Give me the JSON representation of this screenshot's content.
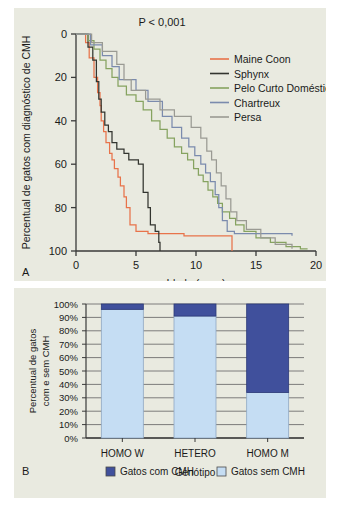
{
  "figure": {
    "background": "#e9eae0",
    "page_background": "#ffffff"
  },
  "panel_a": {
    "label": "A",
    "pvalue": "P < 0,001",
    "ylabel": "Percentual de gatos com diagnóstico de CMH",
    "xlabel": "Idade (anos)",
    "yticks": [
      "0",
      "20",
      "40",
      "60",
      "80",
      "100"
    ],
    "xticks": [
      "0",
      "5",
      "10",
      "15",
      "20"
    ],
    "legend": [
      {
        "label": "Maine Coon",
        "color": "#e8734a"
      },
      {
        "label": "Sphynx",
        "color": "#33352f"
      },
      {
        "label": "Pelo Curto Doméstico",
        "color": "#86a360"
      },
      {
        "label": "Chartreux",
        "color": "#7b8bad"
      },
      {
        "label": "Persa",
        "color": "#9a9a93"
      }
    ]
  },
  "panel_b": {
    "label": "B",
    "ylabel_line1": "Percentual de gatos",
    "ylabel_line2": "com e sem CMH",
    "xlabel": "Genótipo",
    "yticks": [
      "100%",
      "90%",
      "80%",
      "70%",
      "60%",
      "50%",
      "40%",
      "30%",
      "20%",
      "10%",
      "0%"
    ],
    "legend": [
      {
        "label": "Gatos com CMH",
        "color": "#40509c"
      },
      {
        "label": "Gatos sem CMH",
        "color": "#c5ddf3"
      }
    ]
  },
  "chart_data": [
    {
      "type": "line",
      "title": "",
      "subtitle": "Kaplan-Meier: idade ao diagnóstico de CMH por raça",
      "xlabel": "Idade (anos)",
      "ylabel": "Percentual de gatos com diagnóstico de CMH",
      "xlim": [
        0,
        20
      ],
      "ylim": [
        0,
        100
      ],
      "y_axis_inverted": true,
      "xticks": [
        0,
        5,
        10,
        15,
        20
      ],
      "yticks": [
        0,
        20,
        40,
        60,
        80,
        100
      ],
      "grid": false,
      "legend_position": "top-right",
      "annotations": [
        "P < 0,001"
      ],
      "panel_label": "A",
      "step": true,
      "series": [
        {
          "name": "Maine Coon",
          "color": "#e8734a",
          "points": [
            [
              0.0,
              0
            ],
            [
              0.8,
              0
            ],
            [
              0.8,
              4
            ],
            [
              1.1,
              4
            ],
            [
              1.1,
              11
            ],
            [
              1.5,
              11
            ],
            [
              1.5,
              20
            ],
            [
              1.8,
              20
            ],
            [
              1.8,
              27
            ],
            [
              2.0,
              27
            ],
            [
              2.0,
              33
            ],
            [
              2.1,
              33
            ],
            [
              2.1,
              40
            ],
            [
              2.3,
              40
            ],
            [
              2.3,
              45
            ],
            [
              2.5,
              45
            ],
            [
              2.5,
              50
            ],
            [
              2.8,
              50
            ],
            [
              2.8,
              55
            ],
            [
              3.0,
              55
            ],
            [
              3.0,
              58
            ],
            [
              3.2,
              58
            ],
            [
              3.2,
              62
            ],
            [
              3.5,
              62
            ],
            [
              3.5,
              66
            ],
            [
              3.7,
              66
            ],
            [
              3.7,
              70
            ],
            [
              4.0,
              70
            ],
            [
              4.0,
              75
            ],
            [
              4.2,
              75
            ],
            [
              4.2,
              80
            ],
            [
              4.5,
              80
            ],
            [
              4.5,
              88
            ],
            [
              5.0,
              88
            ],
            [
              5.0,
              91
            ],
            [
              6.0,
              91
            ],
            [
              6.0,
              92
            ],
            [
              9.0,
              92
            ],
            [
              9.0,
              93
            ],
            [
              13.0,
              93
            ],
            [
              13.0,
              100
            ]
          ]
        },
        {
          "name": "Sphynx",
          "color": "#33352f",
          "points": [
            [
              0.0,
              0
            ],
            [
              1.0,
              0
            ],
            [
              1.0,
              6
            ],
            [
              1.4,
              6
            ],
            [
              1.4,
              12
            ],
            [
              1.7,
              12
            ],
            [
              1.7,
              22
            ],
            [
              1.9,
              22
            ],
            [
              1.9,
              30
            ],
            [
              2.1,
              30
            ],
            [
              2.1,
              36
            ],
            [
              2.4,
              36
            ],
            [
              2.4,
              42
            ],
            [
              2.7,
              42
            ],
            [
              2.7,
              45
            ],
            [
              3.0,
              45
            ],
            [
              3.0,
              50
            ],
            [
              3.4,
              50
            ],
            [
              3.4,
              53
            ],
            [
              4.0,
              53
            ],
            [
              4.0,
              55
            ],
            [
              4.4,
              55
            ],
            [
              4.4,
              58
            ],
            [
              5.2,
              58
            ],
            [
              5.2,
              60
            ],
            [
              5.6,
              60
            ],
            [
              5.6,
              73
            ],
            [
              6.0,
              73
            ],
            [
              6.0,
              80
            ],
            [
              6.2,
              80
            ],
            [
              6.2,
              88
            ],
            [
              6.6,
              88
            ],
            [
              6.6,
              91
            ],
            [
              6.9,
              91
            ],
            [
              6.9,
              96
            ],
            [
              7.0,
              96
            ],
            [
              7.0,
              100
            ]
          ]
        },
        {
          "name": "Pelo Curto Doméstico",
          "color": "#86a360",
          "points": [
            [
              0.0,
              0
            ],
            [
              1.0,
              0
            ],
            [
              1.0,
              3
            ],
            [
              1.5,
              3
            ],
            [
              1.5,
              7
            ],
            [
              2.0,
              7
            ],
            [
              2.0,
              12
            ],
            [
              2.5,
              12
            ],
            [
              2.5,
              16
            ],
            [
              3.0,
              16
            ],
            [
              3.0,
              20
            ],
            [
              3.5,
              20
            ],
            [
              3.5,
              24
            ],
            [
              4.2,
              24
            ],
            [
              4.2,
              28
            ],
            [
              5.0,
              28
            ],
            [
              5.0,
              31
            ],
            [
              5.6,
              31
            ],
            [
              5.6,
              35
            ],
            [
              6.3,
              35
            ],
            [
              6.3,
              40
            ],
            [
              7.0,
              40
            ],
            [
              7.0,
              44
            ],
            [
              7.6,
              44
            ],
            [
              7.6,
              48
            ],
            [
              8.2,
              48
            ],
            [
              8.2,
              52
            ],
            [
              8.8,
              52
            ],
            [
              8.8,
              55
            ],
            [
              9.3,
              55
            ],
            [
              9.3,
              58
            ],
            [
              9.8,
              58
            ],
            [
              9.8,
              62
            ],
            [
              10.2,
              62
            ],
            [
              10.2,
              65
            ],
            [
              10.6,
              65
            ],
            [
              10.6,
              68
            ],
            [
              11.0,
              68
            ],
            [
              11.0,
              72
            ],
            [
              11.4,
              72
            ],
            [
              11.4,
              75
            ],
            [
              11.8,
              75
            ],
            [
              11.8,
              78
            ],
            [
              12.2,
              78
            ],
            [
              12.2,
              82
            ],
            [
              12.8,
              82
            ],
            [
              12.8,
              85
            ],
            [
              13.3,
              85
            ],
            [
              13.3,
              88
            ],
            [
              14.0,
              88
            ],
            [
              14.0,
              91
            ],
            [
              15.0,
              91
            ],
            [
              15.0,
              94
            ],
            [
              16.2,
              94
            ],
            [
              16.2,
              96
            ],
            [
              17.5,
              96
            ],
            [
              17.5,
              98
            ],
            [
              18.7,
              98
            ],
            [
              18.7,
              99
            ],
            [
              19.3,
              99
            ]
          ]
        },
        {
          "name": "Chartreux",
          "color": "#7b8bad",
          "points": [
            [
              0.0,
              0
            ],
            [
              1.2,
              0
            ],
            [
              1.2,
              5
            ],
            [
              2.2,
              5
            ],
            [
              2.2,
              10
            ],
            [
              3.0,
              10
            ],
            [
              3.0,
              15
            ],
            [
              3.6,
              15
            ],
            [
              3.6,
              21
            ],
            [
              5.0,
              21
            ],
            [
              5.0,
              26
            ],
            [
              6.0,
              26
            ],
            [
              6.0,
              31
            ],
            [
              7.2,
              31
            ],
            [
              7.2,
              38
            ],
            [
              8.0,
              38
            ],
            [
              8.0,
              43
            ],
            [
              8.8,
              43
            ],
            [
              8.8,
              48
            ],
            [
              9.4,
              48
            ],
            [
              9.4,
              52
            ],
            [
              9.9,
              52
            ],
            [
              9.9,
              56
            ],
            [
              10.4,
              56
            ],
            [
              10.4,
              60
            ],
            [
              10.8,
              60
            ],
            [
              10.8,
              64
            ],
            [
              11.2,
              64
            ],
            [
              11.2,
              68
            ],
            [
              11.6,
              68
            ],
            [
              11.6,
              74
            ],
            [
              11.9,
              74
            ],
            [
              11.9,
              80
            ],
            [
              12.2,
              80
            ],
            [
              12.2,
              86
            ],
            [
              12.6,
              86
            ],
            [
              12.6,
              91
            ],
            [
              13.2,
              91
            ],
            [
              13.2,
              92
            ],
            [
              18.0,
              92
            ],
            [
              18.0,
              93
            ]
          ]
        },
        {
          "name": "Persa",
          "color": "#9a9a93",
          "points": [
            [
              0.0,
              0
            ],
            [
              1.3,
              0
            ],
            [
              1.3,
              4
            ],
            [
              2.2,
              4
            ],
            [
              2.2,
              8
            ],
            [
              3.4,
              8
            ],
            [
              3.4,
              14
            ],
            [
              4.0,
              14
            ],
            [
              4.0,
              21
            ],
            [
              4.6,
              21
            ],
            [
              4.6,
              26
            ],
            [
              5.8,
              26
            ],
            [
              5.8,
              30
            ],
            [
              7.0,
              30
            ],
            [
              7.0,
              35
            ],
            [
              8.2,
              35
            ],
            [
              8.2,
              38
            ],
            [
              9.6,
              38
            ],
            [
              9.6,
              43
            ],
            [
              10.4,
              43
            ],
            [
              10.4,
              48
            ],
            [
              10.9,
              48
            ],
            [
              10.9,
              54
            ],
            [
              11.3,
              54
            ],
            [
              11.3,
              58
            ],
            [
              11.7,
              58
            ],
            [
              11.7,
              64
            ],
            [
              12.1,
              64
            ],
            [
              12.1,
              70
            ],
            [
              12.5,
              70
            ],
            [
              12.5,
              76
            ],
            [
              12.9,
              76
            ],
            [
              12.9,
              82
            ],
            [
              13.4,
              82
            ],
            [
              13.4,
              86
            ],
            [
              14.2,
              86
            ],
            [
              14.2,
              90
            ],
            [
              15.4,
              90
            ],
            [
              15.4,
              94
            ],
            [
              16.6,
              94
            ],
            [
              16.6,
              97
            ],
            [
              18.0,
              97
            ],
            [
              18.0,
              99
            ]
          ]
        }
      ]
    },
    {
      "type": "bar",
      "stacked": true,
      "title": "",
      "xlabel": "Genótipo",
      "ylabel": "Percentual de gatos com e sem CMH",
      "categories": [
        "HOMO W",
        "HETERO",
        "HOMO M"
      ],
      "ylim": [
        0,
        100
      ],
      "yticks": [
        0,
        10,
        20,
        30,
        40,
        50,
        60,
        70,
        80,
        90,
        100
      ],
      "ytick_labels": [
        "0%",
        "10%",
        "20%",
        "30%",
        "40%",
        "50%",
        "60%",
        "70%",
        "80%",
        "90%",
        "100%"
      ],
      "grid": true,
      "legend_position": "bottom",
      "panel_label": "B",
      "series": [
        {
          "name": "Gatos sem CMH",
          "color": "#c5ddf3",
          "values": [
            96,
            91,
            34
          ]
        },
        {
          "name": "Gatos com CMH",
          "color": "#40509c",
          "values": [
            4,
            9,
            66
          ]
        }
      ]
    }
  ]
}
